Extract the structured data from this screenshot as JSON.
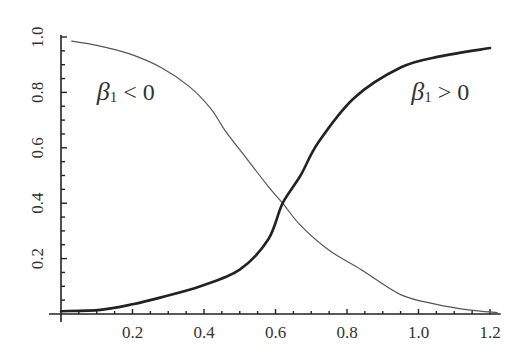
{
  "chart_data": {
    "type": "line",
    "title": "",
    "xlabel": "",
    "ylabel": "",
    "xlim": [
      0,
      1.23
    ],
    "ylim": [
      0,
      1.0
    ],
    "grid": false,
    "legend": null,
    "x_ticks": [
      0.2,
      0.4,
      0.6,
      0.8,
      1.0,
      1.2
    ],
    "x_tick_labels": [
      "0.2",
      "0.4",
      "0.6",
      "0.8",
      "1.0",
      "1.2"
    ],
    "y_ticks": [
      0.2,
      0.4,
      0.6,
      0.8,
      1.0
    ],
    "y_tick_labels": [
      "0.2",
      "0.4",
      "0.6",
      "0.8",
      "1.0"
    ],
    "minor_tick_step": 0.05,
    "annotations": [
      {
        "text": "β1 < 0",
        "beta": "β",
        "sub": "1",
        "rest": " < 0",
        "x": 0.1,
        "y": 0.8
      },
      {
        "text": "β1 > 0",
        "beta": "β",
        "sub": "1",
        "rest": " > 0",
        "x": 0.98,
        "y": 0.8
      }
    ],
    "series": [
      {
        "name": "β1 < 0",
        "style": "thin",
        "color": "#555555",
        "x": [
          0.03,
          0.1,
          0.19,
          0.28,
          0.36,
          0.42,
          0.46,
          0.52,
          0.58,
          0.62,
          0.67,
          0.75,
          0.84,
          0.95,
          1.05,
          1.14,
          1.22
        ],
        "y": [
          0.985,
          0.97,
          0.94,
          0.89,
          0.82,
          0.74,
          0.66,
          0.56,
          0.46,
          0.4,
          0.32,
          0.23,
          0.16,
          0.07,
          0.035,
          0.015,
          0.005
        ]
      },
      {
        "name": "β1 > 0",
        "style": "thick",
        "color": "#222222",
        "x": [
          0.0,
          0.11,
          0.2,
          0.28,
          0.39,
          0.5,
          0.58,
          0.62,
          0.67,
          0.72,
          0.82,
          0.95,
          1.06,
          1.2
        ],
        "y": [
          0.01,
          0.015,
          0.035,
          0.06,
          0.1,
          0.16,
          0.27,
          0.4,
          0.5,
          0.62,
          0.78,
          0.89,
          0.93,
          0.96
        ]
      }
    ]
  }
}
